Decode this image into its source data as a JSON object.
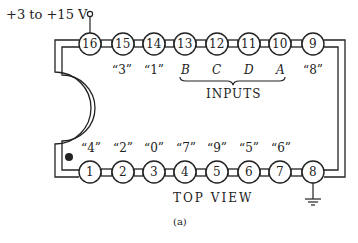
{
  "diagram": {
    "supply_label": "+3 to +15 V",
    "top_pins": [
      {
        "num": "16",
        "label": ""
      },
      {
        "num": "15",
        "label": "“3”"
      },
      {
        "num": "14",
        "label": "“1”"
      },
      {
        "num": "13",
        "label": "B"
      },
      {
        "num": "12",
        "label": "C"
      },
      {
        "num": "11",
        "label": "D"
      },
      {
        "num": "10",
        "label": "A"
      },
      {
        "num": "9",
        "label": "“8”"
      }
    ],
    "bottom_pins": [
      {
        "num": "1",
        "label": "“4”"
      },
      {
        "num": "2",
        "label": "“2”"
      },
      {
        "num": "3",
        "label": "“0”"
      },
      {
        "num": "4",
        "label": "“7”"
      },
      {
        "num": "5",
        "label": "“9”"
      },
      {
        "num": "6",
        "label": "“5”"
      },
      {
        "num": "7",
        "label": "“6”"
      },
      {
        "num": "8",
        "label": ""
      }
    ],
    "inputs_label": "INPUTS",
    "view_label": "TOP VIEW",
    "caption": "(a)",
    "icons": {
      "ground": "ground-icon",
      "pin1_marker": "dot-icon",
      "supply_terminal": "open-circle-terminal-icon"
    }
  }
}
